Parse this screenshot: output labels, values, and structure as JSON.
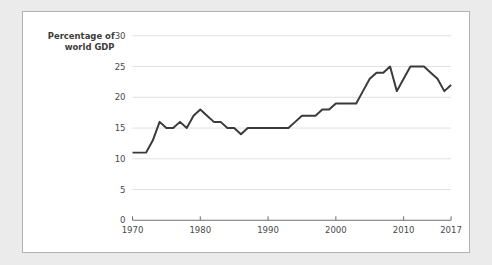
{
  "page": {
    "background_color": "#ebebeb",
    "panel_background": "#ffffff",
    "panel_border_color": "#b2b2b2"
  },
  "chart_data": {
    "type": "line",
    "title": "",
    "ylabel_line1": "Percentage of",
    "ylabel_line2": "world GDP",
    "xlabel": "",
    "xlim": [
      1970,
      2017
    ],
    "ylim": [
      0,
      30
    ],
    "grid": true,
    "legend": "none",
    "line_color": "#3a3a3a",
    "yticks": [
      0,
      5,
      10,
      15,
      20,
      25,
      30
    ],
    "ytick_labels": [
      "0",
      "5",
      "10",
      "15",
      "20",
      "25",
      "30"
    ],
    "xticks": [
      1970,
      1980,
      1990,
      2000,
      2010,
      2017
    ],
    "xtick_labels": [
      "1970",
      "1980",
      "1990",
      "2000",
      "2010",
      "2017"
    ],
    "x": [
      1970,
      1971,
      1972,
      1973,
      1974,
      1975,
      1976,
      1977,
      1978,
      1979,
      1980,
      1981,
      1982,
      1983,
      1984,
      1985,
      1986,
      1987,
      1988,
      1989,
      1990,
      1991,
      1992,
      1993,
      1994,
      1995,
      1996,
      1997,
      1998,
      1999,
      2000,
      2001,
      2002,
      2003,
      2004,
      2005,
      2006,
      2007,
      2008,
      2009,
      2010,
      2011,
      2012,
      2013,
      2014,
      2015,
      2016,
      2017
    ],
    "values": [
      11,
      11,
      11,
      13,
      16,
      15,
      15,
      16,
      15,
      17,
      18,
      17,
      16,
      16,
      15,
      15,
      14,
      15,
      15,
      15,
      15,
      15,
      15,
      15,
      16,
      17,
      17,
      17,
      18,
      18,
      19,
      19,
      19,
      19,
      21,
      23,
      24,
      24,
      25,
      21,
      23,
      25,
      25,
      25,
      24,
      23,
      21,
      22
    ],
    "series_name": "Percentage of world GDP"
  }
}
